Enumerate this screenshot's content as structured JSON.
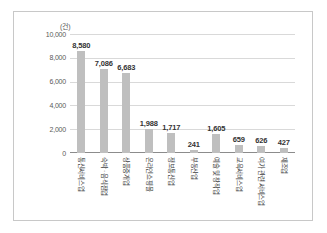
{
  "chart_data": {
    "type": "bar",
    "title": "",
    "xlabel": "",
    "ylabel": "",
    "unit_label": "(건)",
    "ylim": [
      0,
      10000
    ],
    "yticks": [
      "0",
      "2,000",
      "4,000",
      "6,000",
      "8,000",
      "10,000"
    ],
    "ytick_values": [
      0,
      2000,
      4000,
      6000,
      8000,
      10000
    ],
    "grid": true,
    "legend": "none",
    "bar_color": "#bfbfbf",
    "categories": [
      "통신서비스업",
      "숙박 · 음식점업",
      "상품중개업",
      "온라인쇼핑몰",
      "정보통신업",
      "부동산업",
      "예술 및 창작업",
      "교육서비스업",
      "여가 관련 서비스업",
      "제조업"
    ],
    "values": [
      8580,
      7086,
      6683,
      1988,
      1717,
      241,
      1605,
      659,
      626,
      427
    ],
    "value_labels": [
      "8,580",
      "7,086",
      "6,683",
      "1,988",
      "1,717",
      "241",
      "1,605",
      "659",
      "626",
      "427"
    ]
  }
}
